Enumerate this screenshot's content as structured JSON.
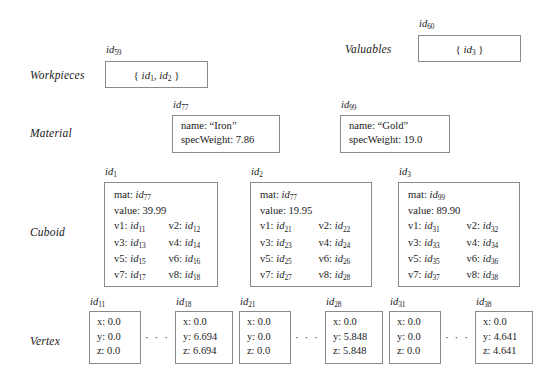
{
  "diagram": {
    "row_labels": {
      "workpieces": "Workpieces",
      "valuables": "Valuables",
      "material": "Material",
      "cuboid": "Cuboid",
      "vertex": "Vertex"
    },
    "ellipsis": "· · ·",
    "sets": [
      {
        "id_prefix": "id",
        "id_sub": "59",
        "content_open": "{",
        "members": [
          {
            "prefix": "id",
            "sub": "1"
          },
          {
            "prefix": "id",
            "sub": "2"
          }
        ],
        "separator": ",",
        "content_close": "}"
      },
      {
        "id_prefix": "id",
        "id_sub": "60",
        "content_open": "{",
        "members": [
          {
            "prefix": "id",
            "sub": "3"
          }
        ],
        "separator": ",",
        "content_close": "}"
      }
    ],
    "materials": [
      {
        "id_prefix": "id",
        "id_sub": "77",
        "name_key": "name:",
        "name_value": "“Iron”",
        "spec_key": "specWeight:",
        "spec_value": "7.86"
      },
      {
        "id_prefix": "id",
        "id_sub": "99",
        "name_key": "name:",
        "name_value": "“Gold”",
        "spec_key": "specWeight:",
        "spec_value": "19.0"
      }
    ],
    "cuboids": [
      {
        "id_prefix": "id",
        "id_sub": "1",
        "mat_key": "mat:",
        "mat_prefix": "id",
        "mat_sub": "77",
        "value_key": "value:",
        "value_value": "39.99",
        "vertices": [
          {
            "key": "v1:",
            "prefix": "id",
            "sub": "11"
          },
          {
            "key": "v2:",
            "prefix": "id",
            "sub": "12"
          },
          {
            "key": "v3:",
            "prefix": "id",
            "sub": "13"
          },
          {
            "key": "v4:",
            "prefix": "id",
            "sub": "14"
          },
          {
            "key": "v5:",
            "prefix": "id",
            "sub": "15"
          },
          {
            "key": "v6:",
            "prefix": "id",
            "sub": "16"
          },
          {
            "key": "v7:",
            "prefix": "id",
            "sub": "17"
          },
          {
            "key": "v8:",
            "prefix": "id",
            "sub": "18"
          }
        ]
      },
      {
        "id_prefix": "id",
        "id_sub": "2",
        "mat_key": "mat:",
        "mat_prefix": "id",
        "mat_sub": "77",
        "value_key": "value:",
        "value_value": "19.95",
        "vertices": [
          {
            "key": "v1:",
            "prefix": "id",
            "sub": "21"
          },
          {
            "key": "v2:",
            "prefix": "id",
            "sub": "22"
          },
          {
            "key": "v3:",
            "prefix": "id",
            "sub": "23"
          },
          {
            "key": "v4:",
            "prefix": "id",
            "sub": "24"
          },
          {
            "key": "v5:",
            "prefix": "id",
            "sub": "25"
          },
          {
            "key": "v6:",
            "prefix": "id",
            "sub": "26"
          },
          {
            "key": "v7:",
            "prefix": "id",
            "sub": "27"
          },
          {
            "key": "v8:",
            "prefix": "id",
            "sub": "28"
          }
        ]
      },
      {
        "id_prefix": "id",
        "id_sub": "3",
        "mat_key": "mat:",
        "mat_prefix": "id",
        "mat_sub": "99",
        "value_key": "value:",
        "value_value": "89.90",
        "vertices": [
          {
            "key": "v1:",
            "prefix": "id",
            "sub": "31"
          },
          {
            "key": "v2:",
            "prefix": "id",
            "sub": "32"
          },
          {
            "key": "v3:",
            "prefix": "id",
            "sub": "33"
          },
          {
            "key": "v4:",
            "prefix": "id",
            "sub": "34"
          },
          {
            "key": "v5:",
            "prefix": "id",
            "sub": "35"
          },
          {
            "key": "v6:",
            "prefix": "id",
            "sub": "36"
          },
          {
            "key": "v7:",
            "prefix": "id",
            "sub": "37"
          },
          {
            "key": "v8:",
            "prefix": "id",
            "sub": "38"
          }
        ]
      }
    ],
    "vertex_keys": {
      "x": "x:",
      "y": "y:",
      "z": "z:"
    },
    "vertices": [
      {
        "id_prefix": "id",
        "id_sub": "11",
        "x": "0.0",
        "y": "0.0",
        "z": "0.0"
      },
      {
        "id_prefix": "id",
        "id_sub": "18",
        "x": "0.0",
        "y": "6.694",
        "z": "6.694"
      },
      {
        "id_prefix": "id",
        "id_sub": "21",
        "x": "0.0",
        "y": "0.0",
        "z": "0.0"
      },
      {
        "id_prefix": "id",
        "id_sub": "28",
        "x": "0.0",
        "y": "5.848",
        "z": "5.848"
      },
      {
        "id_prefix": "id",
        "id_sub": "31",
        "x": "0.0",
        "y": "0.0",
        "z": "0.0"
      },
      {
        "id_prefix": "id",
        "id_sub": "38",
        "x": "0.0",
        "y": "4.641",
        "z": "4.641"
      }
    ]
  }
}
